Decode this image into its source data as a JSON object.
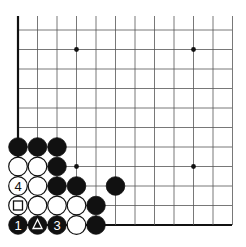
{
  "board": {
    "origin_x": 18,
    "origin_y": 30,
    "spacing": 19.5,
    "cols": 12,
    "rows": 11,
    "grid_color": "#555555",
    "edge_color": "#111111",
    "star_points": [
      [
        3,
        1
      ],
      [
        9,
        1
      ],
      [
        3,
        7
      ],
      [
        9,
        7
      ]
    ],
    "stones": [
      {
        "col": 0,
        "row": 6,
        "color": "black",
        "label": ""
      },
      {
        "col": 1,
        "row": 6,
        "color": "black",
        "label": ""
      },
      {
        "col": 2,
        "row": 6,
        "color": "black",
        "label": ""
      },
      {
        "col": 0,
        "row": 7,
        "color": "white",
        "label": ""
      },
      {
        "col": 1,
        "row": 7,
        "color": "white",
        "label": ""
      },
      {
        "col": 2,
        "row": 7,
        "color": "black",
        "label": ""
      },
      {
        "col": 0,
        "row": 8,
        "color": "white",
        "label": "4"
      },
      {
        "col": 1,
        "row": 8,
        "color": "white",
        "label": ""
      },
      {
        "col": 2,
        "row": 8,
        "color": "black",
        "label": ""
      },
      {
        "col": 3,
        "row": 8,
        "color": "black",
        "label": ""
      },
      {
        "col": 5,
        "row": 8,
        "color": "black",
        "label": ""
      },
      {
        "col": 0,
        "row": 9,
        "color": "white",
        "label": "square"
      },
      {
        "col": 1,
        "row": 9,
        "color": "white",
        "label": ""
      },
      {
        "col": 2,
        "row": 9,
        "color": "white",
        "label": ""
      },
      {
        "col": 3,
        "row": 9,
        "color": "white",
        "label": ""
      },
      {
        "col": 4,
        "row": 9,
        "color": "black",
        "label": ""
      },
      {
        "col": 0,
        "row": 10,
        "color": "black",
        "label": "1"
      },
      {
        "col": 1,
        "row": 10,
        "color": "black",
        "label": "triangle"
      },
      {
        "col": 2,
        "row": 10,
        "color": "black",
        "label": "3"
      },
      {
        "col": 3,
        "row": 10,
        "color": "white",
        "label": ""
      },
      {
        "col": 4,
        "row": 10,
        "color": "black",
        "label": ""
      }
    ]
  }
}
